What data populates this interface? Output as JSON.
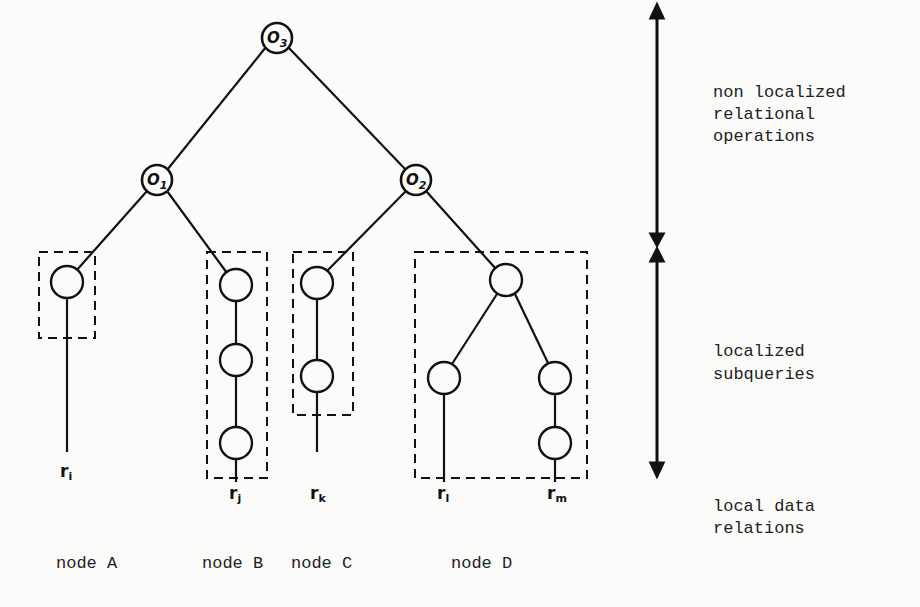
{
  "diagram": {
    "type": "query-tree",
    "operators": [
      {
        "id": "o3",
        "label": "O",
        "sub": "3"
      },
      {
        "id": "o1",
        "label": "O",
        "sub": "1"
      },
      {
        "id": "o2",
        "label": "O",
        "sub": "2"
      }
    ],
    "relations": [
      {
        "id": "ri",
        "label": "r",
        "sub": "i"
      },
      {
        "id": "rj",
        "label": "r",
        "sub": "j"
      },
      {
        "id": "rk",
        "label": "r",
        "sub": "k"
      },
      {
        "id": "rl",
        "label": "r",
        "sub": "l"
      },
      {
        "id": "rm",
        "label": "r",
        "sub": "m"
      }
    ],
    "nodes": [
      {
        "id": "A",
        "label": "node A"
      },
      {
        "id": "B",
        "label": "node B"
      },
      {
        "id": "C",
        "label": "node C"
      },
      {
        "id": "D",
        "label": "node D"
      }
    ],
    "annotations": {
      "non_localized": [
        "non localized",
        "relational",
        "operations"
      ],
      "localized": [
        "localized",
        "subqueries"
      ],
      "local_data": [
        "local data",
        "relations"
      ]
    },
    "colors": {
      "ink": "#111111",
      "paper": "#fbfbfa"
    }
  }
}
